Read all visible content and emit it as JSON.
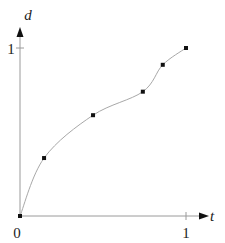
{
  "chart_data": {
    "type": "line",
    "title": "",
    "xlabel": "t",
    "ylabel": "d",
    "xlim": [
      0,
      1
    ],
    "ylim": [
      0,
      1
    ],
    "grid": false,
    "x_ticks": [
      {
        "value": 1,
        "label": "1"
      }
    ],
    "y_ticks": [
      {
        "value": 1,
        "label": "1"
      }
    ],
    "origin_label": "0",
    "series": [
      {
        "name": "d(t)",
        "smooth": true,
        "markers": "square",
        "x": [
          0,
          0.145,
          0.44,
          0.74,
          0.86,
          1.0
        ],
        "y": [
          0,
          0.345,
          0.6,
          0.74,
          0.9,
          1.0
        ]
      }
    ],
    "colors": {
      "curve": "#a8a8a8",
      "axis": "#9a9a9a",
      "marker": "#111111"
    }
  }
}
